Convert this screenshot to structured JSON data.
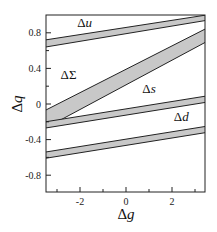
{
  "chart_data": {
    "type": "area",
    "title": "",
    "xlabel": "Δg",
    "ylabel": "Δq",
    "xlim": [
      -3.5,
      3.5
    ],
    "ylim": [
      -1.0,
      1.0
    ],
    "xticks": [
      -2,
      0,
      2
    ],
    "xtick_labels": [
      "-2",
      "0",
      "2"
    ],
    "xminor": [
      -3,
      -1,
      1,
      3
    ],
    "yticks": [
      0.8,
      0.4,
      0,
      -0.4,
      -0.8
    ],
    "ytick_labels": [
      "0.8",
      "0.4",
      "0",
      "-0.4",
      "-0.8"
    ],
    "yminor": [
      0.6,
      0.2,
      -0.2,
      -0.6
    ],
    "grid": false,
    "legend": "none (inline band labels)",
    "fill_color": "#c8c8c8",
    "line_color": "#222222",
    "series": [
      {
        "name": "Δu",
        "x": [
          -3.5,
          3.5
        ],
        "upper": [
          0.72,
          1.0
        ],
        "lower": [
          0.64,
          0.94
        ],
        "label_pos": [
          -1.8,
          0.86
        ]
      },
      {
        "name": "ΔΣ",
        "x": [
          -3.5,
          3.5
        ],
        "upper": [
          -0.07,
          0.85
        ],
        "lower": [
          -0.27,
          0.7
        ],
        "label_pos": [
          -2.5,
          0.28
        ]
      },
      {
        "name": "Δs",
        "x": [
          -3.5,
          3.5
        ],
        "upper": [
          -0.2,
          0.09
        ],
        "lower": [
          -0.27,
          0.02
        ],
        "label_pos": [
          1.0,
          0.12
        ]
      },
      {
        "name": "Δd",
        "x": [
          -3.5,
          3.5
        ],
        "upper": [
          -0.54,
          -0.25
        ],
        "lower": [
          -0.61,
          -0.32
        ],
        "label_pos": [
          2.4,
          -0.19
        ]
      }
    ]
  }
}
